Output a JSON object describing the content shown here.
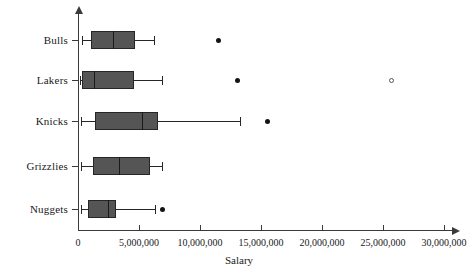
{
  "chart_data": {
    "type": "box",
    "title": "",
    "xlabel": "Salary",
    "ylabel": "",
    "xlim": [
      0,
      31000000
    ],
    "xticks": [
      0,
      5000000,
      10000000,
      15000000,
      20000000,
      25000000,
      30000000
    ],
    "xticklabels": [
      "0",
      "5,000,000",
      "10,000,000",
      "15,000,000",
      "20,000,000",
      "25,000,000",
      "30,000,000"
    ],
    "categories": [
      "Bulls",
      "Lakers",
      "Knicks",
      "Grizzlies",
      "Nuggets"
    ],
    "grid": false,
    "legend": false,
    "orientation": "horizontal",
    "box_fill_color": "#555555",
    "box_edge_color": "#262626",
    "outlier_color": "#141414",
    "axis_color": "#3a3a3a",
    "boxes": [
      {
        "category": "Bulls",
        "whisker_low": 300000,
        "q1": 1050000,
        "median": 2850000,
        "q3": 4700000,
        "whisker_high": 6250000,
        "outliers": [
          {
            "value": 11500000,
            "filled": true
          }
        ]
      },
      {
        "category": "Lakers",
        "whisker_low": 200000,
        "q1": 350000,
        "median": 1300000,
        "q3": 4550000,
        "whisker_high": 6850000,
        "outliers": [
          {
            "value": 13100000,
            "filled": true
          },
          {
            "value": 25700000,
            "filled": false
          }
        ]
      },
      {
        "category": "Knicks",
        "whisker_low": 250000,
        "q1": 1400000,
        "median": 5250000,
        "q3": 6550000,
        "whisker_high": 13300000,
        "outliers": [
          {
            "value": 15500000,
            "filled": true
          }
        ]
      },
      {
        "category": "Grizzlies",
        "whisker_low": 250000,
        "q1": 1200000,
        "median": 3350000,
        "q3": 5900000,
        "whisker_high": 6900000,
        "outliers": []
      },
      {
        "category": "Nuggets",
        "whisker_low": 250000,
        "q1": 800000,
        "median": 2450000,
        "q3": 3100000,
        "whisker_high": 6300000,
        "outliers": [
          {
            "value": 6950000,
            "filled": true
          }
        ]
      }
    ]
  }
}
